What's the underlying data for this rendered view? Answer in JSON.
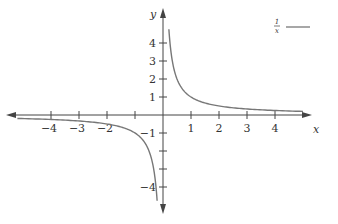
{
  "chart_data": {
    "type": "line",
    "title": "",
    "xlabel": "x",
    "ylabel": "y",
    "xlim": [
      -5.5,
      5.5
    ],
    "ylim": [
      -5.3,
      4.7
    ],
    "grid": false,
    "legend_position": "top-right",
    "x_ticks": [
      -4,
      -3,
      -2,
      -1,
      1,
      2,
      3,
      4
    ],
    "x_tick_labels": [
      "−4",
      "−3",
      "−2",
      "",
      "1",
      "2",
      "3",
      "4"
    ],
    "y_ticks": [
      -4,
      -3,
      -2,
      -1,
      1,
      2,
      3,
      4
    ],
    "y_tick_labels": [
      "−4",
      "",
      "",
      "−1",
      "1",
      "2",
      "3",
      "4"
    ],
    "series": [
      {
        "name": "1/x",
        "function": "1/x",
        "color": "#777777",
        "branches": [
          {
            "x": [
              0.21,
              0.25,
              0.3,
              0.4,
              0.5,
              0.75,
              1,
              1.5,
              2,
              3,
              4,
              5
            ],
            "y": [
              4.76,
              4,
              3.33,
              2.5,
              2,
              1.33,
              1,
              0.67,
              0.5,
              0.33,
              0.25,
              0.2
            ]
          },
          {
            "x": [
              -5.2,
              -4,
              -3,
              -2,
              -1.5,
              -1,
              -0.75,
              -0.5,
              -0.4,
              -0.3,
              -0.25,
              -0.21
            ],
            "y": [
              -0.19,
              -0.25,
              -0.33,
              -0.5,
              -0.67,
              -1,
              -1.33,
              -2,
              -2.5,
              -3.33,
              -4,
              -4.76
            ]
          }
        ]
      }
    ]
  },
  "legend": {
    "numerator": "1",
    "denominator": "x"
  },
  "axes": {
    "x_label": "x",
    "y_label": "y"
  }
}
